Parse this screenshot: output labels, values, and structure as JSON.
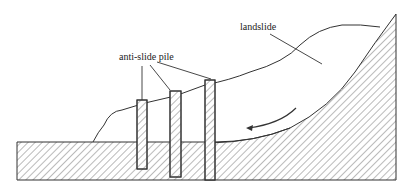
{
  "diagram": {
    "labels": {
      "landslide": "landslide",
      "anti_slide_pile": "anti-slide pile"
    },
    "elements": [
      {
        "name": "bedrock-ground",
        "description": "hatched stable ground / bedrock"
      },
      {
        "name": "landslide-body",
        "description": "sliding soil mass above slip surface"
      },
      {
        "name": "slip-surface",
        "description": "curved sliding surface"
      },
      {
        "name": "anti-slide-pile",
        "count": 3
      },
      {
        "name": "sliding-direction-arrow",
        "description": "curved arrow pointing downslope (left)"
      }
    ],
    "colors": {
      "line": "#333333",
      "hatch": "#555555",
      "background": "#ffffff"
    }
  }
}
